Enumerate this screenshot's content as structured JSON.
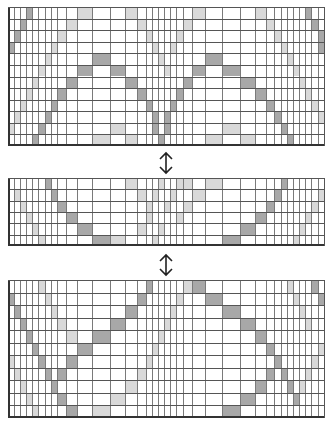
{
  "figure": {
    "caption_fragment": "",
    "arrow_glyph": "↕",
    "colors": {
      "dark": "#a8a8a8",
      "light": "#d9d9d9",
      "line": "#7a7a7a",
      "border": "#333333",
      "background": "#ffffff"
    }
  },
  "columns_x": [
    8,
    14,
    20,
    26,
    32,
    38,
    45,
    51,
    57,
    66,
    77,
    92,
    110,
    125,
    137,
    146,
    152,
    158,
    164,
    170,
    176,
    183,
    192,
    205,
    222,
    240,
    255,
    266,
    274,
    281,
    287,
    293,
    299,
    305,
    311,
    318,
    325
  ],
  "grids": [
    {
      "name": "top-grid",
      "top": 7,
      "bottom": 146,
      "rows": 12,
      "dark": [
        [
          0,
          3
        ],
        [
          1,
          2
        ],
        [
          2,
          1
        ],
        [
          3,
          0
        ],
        [
          4,
          11
        ],
        [
          4,
          23
        ],
        [
          5,
          10
        ],
        [
          5,
          12
        ],
        [
          5,
          22
        ],
        [
          5,
          24
        ],
        [
          6,
          9
        ],
        [
          6,
          13
        ],
        [
          6,
          21
        ],
        [
          6,
          25
        ],
        [
          7,
          8
        ],
        [
          7,
          14
        ],
        [
          7,
          20
        ],
        [
          7,
          26
        ],
        [
          8,
          7
        ],
        [
          8,
          15
        ],
        [
          8,
          19
        ],
        [
          8,
          27
        ],
        [
          9,
          6
        ],
        [
          9,
          16
        ],
        [
          9,
          18
        ],
        [
          9,
          28
        ],
        [
          10,
          5
        ],
        [
          10,
          16
        ],
        [
          10,
          18
        ],
        [
          10,
          29
        ],
        [
          11,
          4
        ],
        [
          11,
          17
        ],
        [
          11,
          30
        ],
        [
          0,
          33
        ],
        [
          1,
          34
        ],
        [
          2,
          35
        ],
        [
          3,
          35
        ]
      ],
      "light": [
        [
          0,
          10
        ],
        [
          0,
          13
        ],
        [
          0,
          22
        ],
        [
          0,
          26
        ],
        [
          1,
          9
        ],
        [
          1,
          14
        ],
        [
          1,
          21
        ],
        [
          1,
          27
        ],
        [
          2,
          8
        ],
        [
          2,
          15
        ],
        [
          2,
          20
        ],
        [
          2,
          28
        ],
        [
          3,
          7
        ],
        [
          3,
          16
        ],
        [
          3,
          19
        ],
        [
          3,
          29
        ],
        [
          4,
          6
        ],
        [
          4,
          17
        ],
        [
          4,
          30
        ],
        [
          5,
          5
        ],
        [
          5,
          18
        ],
        [
          5,
          31
        ],
        [
          6,
          4
        ],
        [
          6,
          32
        ],
        [
          7,
          3
        ],
        [
          7,
          33
        ],
        [
          8,
          2
        ],
        [
          8,
          34
        ],
        [
          9,
          1
        ],
        [
          9,
          35
        ],
        [
          10,
          12
        ],
        [
          10,
          24
        ],
        [
          11,
          11
        ],
        [
          11,
          13
        ],
        [
          11,
          23
        ],
        [
          11,
          25
        ],
        [
          10,
          0
        ]
      ]
    },
    {
      "name": "middle-grid",
      "top": 178,
      "bottom": 246,
      "rows": 6,
      "dark": [
        [
          0,
          6
        ],
        [
          1,
          7
        ],
        [
          2,
          8
        ],
        [
          3,
          9
        ],
        [
          4,
          10
        ],
        [
          5,
          11
        ],
        [
          5,
          24
        ],
        [
          4,
          25
        ],
        [
          3,
          26
        ],
        [
          2,
          27
        ],
        [
          1,
          28
        ],
        [
          0,
          29
        ]
      ],
      "light": [
        [
          0,
          13
        ],
        [
          0,
          17
        ],
        [
          0,
          20
        ],
        [
          0,
          23
        ],
        [
          1,
          1
        ],
        [
          1,
          14
        ],
        [
          1,
          16
        ],
        [
          1,
          19
        ],
        [
          1,
          22
        ],
        [
          1,
          35
        ],
        [
          2,
          2
        ],
        [
          2,
          15
        ],
        [
          2,
          18
        ],
        [
          2,
          21
        ],
        [
          2,
          34
        ],
        [
          3,
          3
        ],
        [
          3,
          15
        ],
        [
          3,
          20
        ],
        [
          3,
          33
        ],
        [
          4,
          4
        ],
        [
          4,
          14
        ],
        [
          4,
          17
        ],
        [
          4,
          32
        ],
        [
          5,
          5
        ],
        [
          5,
          16
        ],
        [
          5,
          31
        ],
        [
          5,
          12
        ],
        [
          0,
          21
        ]
      ]
    },
    {
      "name": "bottom-grid",
      "top": 280,
      "bottom": 418,
      "rows": 11,
      "dark": [
        [
          0,
          15
        ],
        [
          0,
          22
        ],
        [
          1,
          0
        ],
        [
          1,
          14
        ],
        [
          1,
          23
        ],
        [
          2,
          1
        ],
        [
          2,
          13
        ],
        [
          2,
          24
        ],
        [
          3,
          2
        ],
        [
          3,
          12
        ],
        [
          3,
          25
        ],
        [
          4,
          3
        ],
        [
          4,
          11
        ],
        [
          4,
          26
        ],
        [
          5,
          4
        ],
        [
          5,
          10
        ],
        [
          5,
          27
        ],
        [
          6,
          5
        ],
        [
          6,
          9
        ],
        [
          6,
          28
        ],
        [
          7,
          6
        ],
        [
          7,
          8
        ],
        [
          7,
          29
        ],
        [
          8,
          7
        ],
        [
          8,
          30
        ],
        [
          9,
          8
        ],
        [
          9,
          31
        ],
        [
          10,
          9
        ],
        [
          10,
          24
        ],
        [
          9,
          25
        ],
        [
          8,
          26
        ],
        [
          7,
          27
        ],
        [
          0,
          34
        ],
        [
          1,
          35
        ]
      ],
      "light": [
        [
          0,
          5
        ],
        [
          0,
          21
        ],
        [
          0,
          30
        ],
        [
          1,
          6
        ],
        [
          1,
          20
        ],
        [
          1,
          31
        ],
        [
          2,
          7
        ],
        [
          2,
          19
        ],
        [
          2,
          32
        ],
        [
          3,
          8
        ],
        [
          3,
          18
        ],
        [
          3,
          33
        ],
        [
          4,
          9
        ],
        [
          4,
          17
        ],
        [
          5,
          10
        ],
        [
          5,
          16
        ],
        [
          6,
          0
        ],
        [
          6,
          15
        ],
        [
          7,
          1
        ],
        [
          7,
          14
        ],
        [
          8,
          2
        ],
        [
          8,
          13
        ],
        [
          9,
          3
        ],
        [
          9,
          12
        ],
        [
          10,
          4
        ],
        [
          10,
          11
        ],
        [
          6,
          34
        ],
        [
          7,
          33
        ],
        [
          8,
          32
        ],
        [
          9,
          31
        ],
        [
          5,
          35
        ]
      ]
    }
  ],
  "arrows": [
    {
      "name": "double-arrow-1",
      "x": 157,
      "y": 151
    },
    {
      "name": "double-arrow-2",
      "x": 157,
      "y": 253
    }
  ]
}
